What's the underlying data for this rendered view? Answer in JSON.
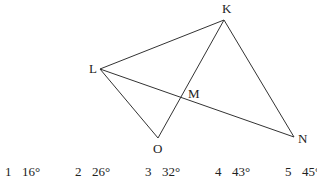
{
  "figure": {
    "points": {
      "K": {
        "label": "K",
        "x": 224,
        "y": 20,
        "lx": 222,
        "ly": 13
      },
      "L": {
        "label": "L",
        "x": 100,
        "y": 69,
        "lx": 89,
        "ly": 73
      },
      "M": {
        "label": "M",
        "x": 182,
        "y": 97,
        "lx": 188,
        "ly": 98
      },
      "O": {
        "label": "O",
        "x": 158,
        "y": 138,
        "lx": 153,
        "ly": 153
      },
      "N": {
        "label": "N",
        "x": 294,
        "y": 137,
        "lx": 298,
        "ly": 143
      }
    },
    "segments": [
      [
        "L",
        "K"
      ],
      [
        "K",
        "N"
      ],
      [
        "L",
        "N"
      ],
      [
        "L",
        "O"
      ],
      [
        "O",
        "K"
      ]
    ],
    "line_color": "#333333"
  },
  "choices": [
    {
      "num": "1",
      "value": "16°"
    },
    {
      "num": "2",
      "value": "26°"
    },
    {
      "num": "3",
      "value": "32°"
    },
    {
      "num": "4",
      "value": "43°"
    },
    {
      "num": "5",
      "value": "45°"
    }
  ]
}
